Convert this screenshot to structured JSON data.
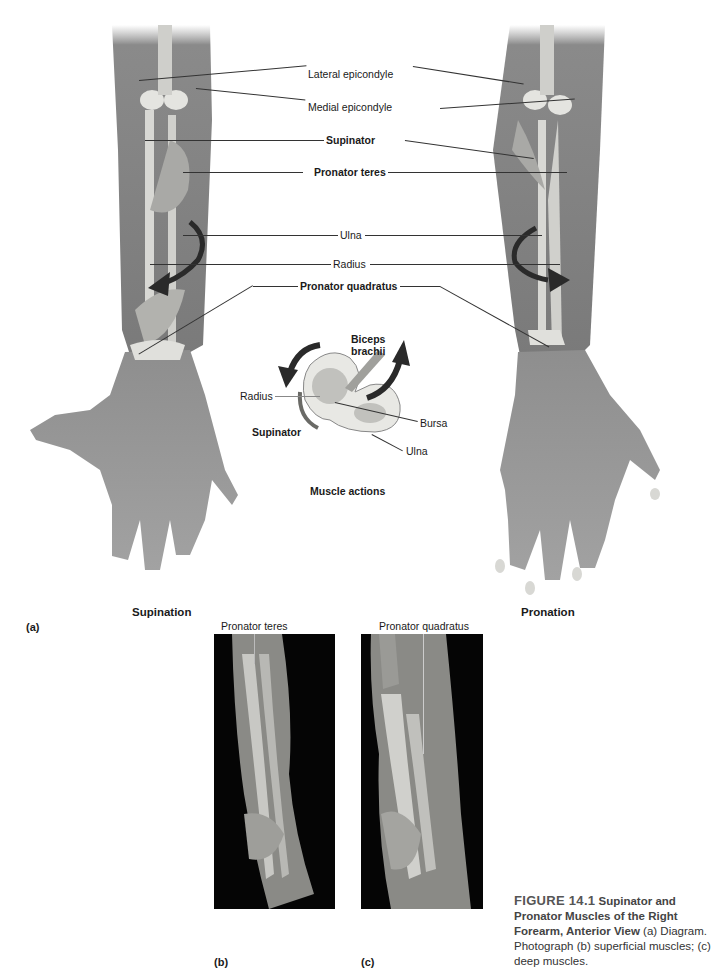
{
  "figure": {
    "number": "FIGURE 14.1",
    "title": "Supinator and Pronator Muscles of the Right Forearm, Anterior View",
    "description": "(a) Diagram. Photograph (b) superficial muscles; (c) deep muscles."
  },
  "panel_a": {
    "panel_label": "(a)",
    "left_arm_caption": "Supination",
    "right_arm_caption": "Pronation",
    "labels": {
      "lateral_epicondyle": "Lateral epicondyle",
      "medial_epicondyle": "Medial epicondyle",
      "supinator": "Supinator",
      "pronator_teres": "Pronator teres",
      "ulna": "Ulna",
      "radius": "Radius",
      "pronator_quadratus": "Pronator quadratus"
    },
    "inset": {
      "title": "Muscle actions",
      "labels": {
        "biceps_brachii_line1": "Biceps",
        "biceps_brachii_line2": "brachii",
        "radius": "Radius",
        "bursa": "Bursa",
        "supinator": "Supinator",
        "ulna": "Ulna"
      }
    }
  },
  "panel_b": {
    "panel_label": "(b)",
    "label": "Pronator teres"
  },
  "panel_c": {
    "panel_label": "(c)",
    "label": "Pronator quadratus"
  },
  "colors": {
    "skin": "#8c8c8c",
    "skin_dark": "#6e6e6e",
    "bone": "#e4e4e0",
    "muscle": "#a9a9a6",
    "arrow": "#2a2a2a",
    "photo_bg": "#050505",
    "text": "#1a1a1a",
    "caption_text": "#444444"
  }
}
